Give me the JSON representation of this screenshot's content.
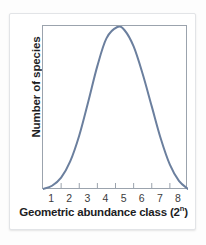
{
  "figure": {
    "card_background": "#ffffff",
    "page_background": "#fdfdfd",
    "frame_color": "#9ba3ad"
  },
  "axes": {
    "y_title": "Number of species",
    "x_title_main": "Geometric abundance class (2",
    "x_title_superscript": "n",
    "x_title_close": ")",
    "x_tick_labels": [
      "1",
      "2",
      "3",
      "4",
      "5",
      "6",
      "7",
      "8"
    ]
  },
  "chart_data": {
    "type": "line",
    "title": "",
    "subtitle": "",
    "xlabel": "Geometric abundance class (2^n)",
    "ylabel": "Number of species",
    "xlim": [
      0.5,
      8.5
    ],
    "ylim": [
      0,
      1.0
    ],
    "grid": false,
    "legend": "none",
    "x_tick_labels": [
      "1",
      "2",
      "3",
      "4",
      "5",
      "6",
      "7",
      "8"
    ],
    "x_ticks": [
      1,
      2,
      3,
      4,
      5,
      6,
      7,
      8
    ],
    "y_ticks": [],
    "annotations": [],
    "series": [
      {
        "name": "Species abundance distribution",
        "color": "#6b7f9e",
        "line_width": 2,
        "shape": "bell curve (lognormal / normal)",
        "peak_x": 4.6,
        "peak_y": 1.0,
        "x": [
          0.5,
          1.0,
          1.5,
          2.0,
          2.5,
          3.0,
          3.5,
          4.0,
          4.6,
          5.0,
          5.5,
          6.0,
          6.5,
          7.0,
          7.5,
          8.0,
          8.5
        ],
        "values": [
          0.0,
          0.02,
          0.07,
          0.17,
          0.33,
          0.54,
          0.76,
          0.93,
          1.0,
          0.98,
          0.88,
          0.71,
          0.51,
          0.31,
          0.15,
          0.05,
          0.0
        ]
      }
    ]
  }
}
